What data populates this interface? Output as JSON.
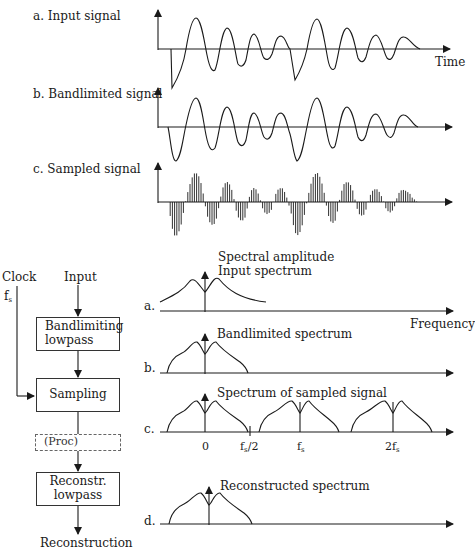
{
  "time_signals": {
    "a_label": "a. Input signal",
    "b_label": "b. Bandlimited signal",
    "c_label": "c. Sampled signal",
    "time_axis_label": "Time"
  },
  "block_diagram": {
    "clock_label": "Clock",
    "clock_freq": "f",
    "clock_freq_sub": "s",
    "input_label": "Input",
    "blocks": [
      {
        "line1": "Bandlimiting",
        "line2": "lowpass"
      },
      {
        "line1": "Sampling",
        "line2": ""
      },
      {
        "line1": "(Proc)",
        "line2": ""
      },
      {
        "line1": "Reconstr.",
        "line2": "lowpass"
      }
    ],
    "output_label": "Reconstruction"
  },
  "spectra": {
    "a": {
      "letter": "a.",
      "title1": "Spectral amplitude",
      "title2": "Input spectrum"
    },
    "frequency_axis_label": "Frequency",
    "b": {
      "letter": "b.",
      "title": "Bandlimited spectrum"
    },
    "c": {
      "letter": "c.",
      "title": "Spectrum of sampled signal",
      "ticks": [
        {
          "main": "0",
          "sub": ""
        },
        {
          "main": "f",
          "sub": "s",
          "suffix": "/2"
        },
        {
          "main": "f",
          "sub": "s"
        },
        {
          "main": "2f",
          "sub": "s"
        }
      ]
    },
    "d": {
      "letter": "d.",
      "title": "Reconstructed spectrum"
    }
  },
  "colors": {
    "ink": "#1a1a1a",
    "background": "#ffffff",
    "dashed": "#666666"
  }
}
